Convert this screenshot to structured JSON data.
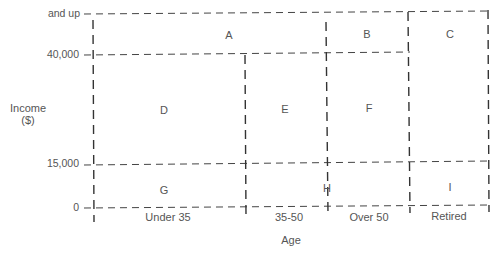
{
  "diagram": {
    "y_axis": {
      "label_line1": "Income",
      "label_line2": "($)",
      "ticks": [
        "and up",
        "40,000",
        "15,000",
        "0"
      ]
    },
    "x_axis": {
      "label": "Age",
      "categories": [
        "Under 35",
        "35-50",
        "Over 50",
        "Retired"
      ]
    },
    "cells": {
      "A": "A",
      "B": "B",
      "C": "C",
      "D": "D",
      "E": "E",
      "F": "F",
      "G": "G",
      "H": "H",
      "I": "I"
    }
  }
}
